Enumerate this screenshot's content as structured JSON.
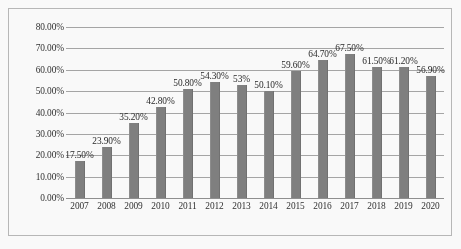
{
  "chart_data": {
    "type": "bar",
    "title": "",
    "subtitle": "",
    "xlabel": "",
    "ylabel": "",
    "categories": [
      "2007",
      "2008",
      "2009",
      "2010",
      "2011",
      "2012",
      "2013",
      "2014",
      "2015",
      "2016",
      "2017",
      "2018",
      "2019",
      "2020"
    ],
    "values": [
      17.5,
      23.9,
      35.2,
      42.8,
      50.8,
      54.3,
      53.0,
      50.1,
      59.6,
      64.7,
      67.5,
      61.5,
      61.2,
      56.9
    ],
    "data_labels": [
      "17.50%",
      "23.90%",
      "35.20%",
      "42.80%",
      "50.80%",
      "54.30%",
      "53%",
      "50.10%",
      "59.60%",
      "64.70%",
      "67.50%",
      "61.50%",
      "61.20%",
      "56.90%"
    ],
    "ylim": [
      0,
      80
    ],
    "ytick_values": [
      0,
      10,
      20,
      30,
      40,
      50,
      60,
      70,
      80
    ],
    "ytick_labels": [
      "0.00%",
      "10.00%",
      "20.00%",
      "30.00%",
      "40.00%",
      "50.00%",
      "60.00%",
      "70.00%",
      "80.00%"
    ],
    "grid": true,
    "grid_axis": "y",
    "legend": false,
    "legend_position": "none",
    "series": [
      {
        "name": "",
        "values": [
          17.5,
          23.9,
          35.2,
          42.8,
          50.8,
          54.3,
          53.0,
          50.1,
          59.6,
          64.7,
          67.5,
          61.5,
          61.2,
          56.9
        ]
      }
    ],
    "colors": {
      "bar": "#7e7e7e",
      "gridline": "#a6a6a6",
      "axis": "#8f8f8f",
      "text": "#2b2b2b",
      "frame": "#b9b9b9",
      "background": "#ffffff"
    }
  }
}
